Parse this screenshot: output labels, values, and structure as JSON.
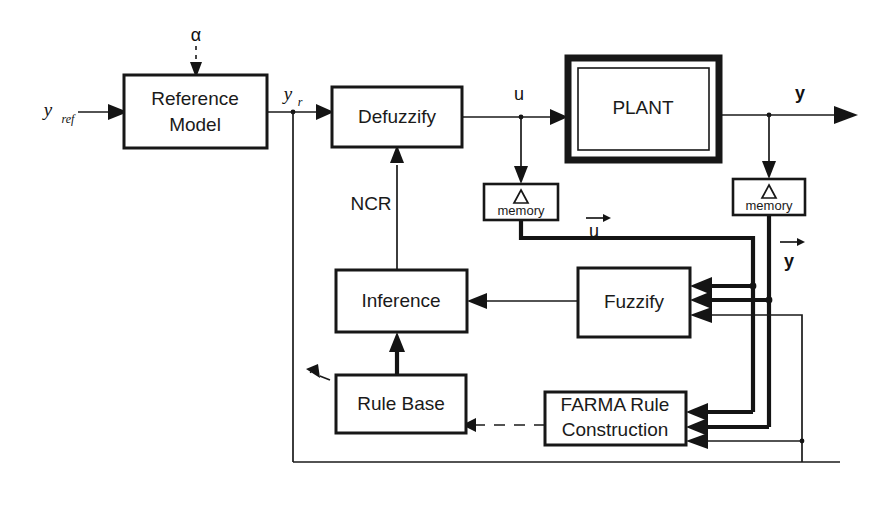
{
  "diagram": {
    "blocks": [
      {
        "id": "reference_model",
        "label_line1": "Reference",
        "label_line2": "Model",
        "name": "reference-model-block"
      },
      {
        "id": "defuzzify",
        "label_line1": "Defuzzify",
        "label_line2": "",
        "name": "defuzzify-block"
      },
      {
        "id": "plant",
        "label_line1": "PLANT",
        "label_line2": "",
        "name": "plant-block"
      },
      {
        "id": "u_memory",
        "label_line1": "memory",
        "label_line2": "",
        "name": "u-memory-block"
      },
      {
        "id": "y_memory",
        "label_line1": "memory",
        "label_line2": "",
        "name": "y-memory-block"
      },
      {
        "id": "inference",
        "label_line1": "Inference",
        "label_line2": "",
        "name": "inference-block"
      },
      {
        "id": "fuzzify",
        "label_line1": "Fuzzify",
        "label_line2": "",
        "name": "fuzzify-block"
      },
      {
        "id": "rule_base",
        "label_line1": "Rule Base",
        "label_line2": "",
        "name": "rule-base-block"
      },
      {
        "id": "farma",
        "label_line1": "FARMA Rule",
        "label_line2": "Construction",
        "name": "farma-rule-construction-block"
      }
    ],
    "signals": {
      "alpha": "α",
      "y_ref_base": "y",
      "y_ref_sub": "ref",
      "y_r_base": "y",
      "y_r_sub": "r",
      "u": "u",
      "y_out": "y",
      "ncr": "NCR",
      "u_vector": "u",
      "y_vector": "y",
      "delta": "Δ"
    },
    "colors": {
      "ink": "#1a1a1a",
      "background": "#ffffff"
    }
  }
}
